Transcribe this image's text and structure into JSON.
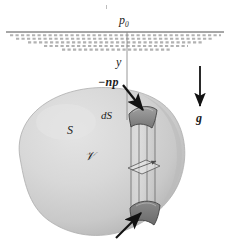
{
  "figure": {
    "domain": "diagram",
    "width": 230,
    "height": 245,
    "background_color": "#ffffff"
  },
  "labels": {
    "surface_pressure": "p",
    "surface_pressure_sub": "0",
    "axis_y": "y",
    "pressure_force": "−np",
    "area_element": "dS",
    "surface": "S",
    "volume": "𝒱",
    "gravity": "g"
  },
  "colors": {
    "ink": "#1b1b1b",
    "body_fill_light": "#dcdcdc",
    "body_fill_mid": "#cfcfcf",
    "body_fill_dark": "#b6b6b6",
    "body_edge": "#a8a8a8",
    "cap_fill": "#8f8f8f",
    "cap_fill_dark": "#6e6e6e",
    "hatch": "#b9b9b9",
    "surface_line": "#3a3a3a",
    "prism_edge": "#6f6f6f",
    "arrow": "#121212"
  },
  "elements": {
    "free_surface": {
      "name": "free-surface-line",
      "y": 32,
      "x_start": 6,
      "x_end": 224
    },
    "hatching": {
      "name": "surface-hatching",
      "rows": 5,
      "top": 34,
      "row_height": 3.6,
      "dash": "3 2"
    },
    "y_axis_line": {
      "name": "y-axis-line",
      "x": 127,
      "y_top": 32,
      "y_bottom": 120
    },
    "gravity_arrow": {
      "name": "gravity-arrow",
      "x": 200,
      "y_top": 68,
      "y_bottom": 108,
      "direction": "down"
    },
    "np_arrow": {
      "name": "pressure-force-arrow",
      "from_x": 124,
      "from_y": 86,
      "to_x": 144,
      "to_y": 110,
      "direction": "down-right"
    },
    "bottom_arrow": {
      "name": "bottom-pressure-force-arrow",
      "from_x": 118,
      "from_y": 236,
      "to_x": 143,
      "to_y": 212,
      "direction": "up-right"
    },
    "prism": {
      "name": "elemental-prism",
      "x_left": 131,
      "x_right": 155,
      "y_top": 112,
      "y_bottom": 214,
      "cap_top_label": "dS",
      "has_mid_cross_section": true
    }
  }
}
